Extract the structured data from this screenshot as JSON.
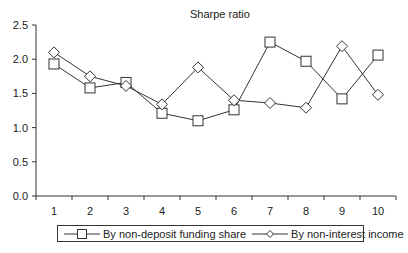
{
  "chart_data": {
    "type": "line",
    "title": "Sharpe ratio",
    "xlabel": "",
    "ylabel": "",
    "categories": [
      "1",
      "2",
      "3",
      "4",
      "5",
      "6",
      "7",
      "8",
      "9",
      "10"
    ],
    "y_ticks": [
      "0.0",
      "0.5",
      "1.0",
      "1.5",
      "2.0",
      "2.5"
    ],
    "ylim": [
      0,
      2.5
    ],
    "grid": false,
    "legend_position": "bottom",
    "series": [
      {
        "name": "By non-deposit funding share",
        "marker": "square",
        "values": [
          1.93,
          1.58,
          1.66,
          1.21,
          1.1,
          1.26,
          2.25,
          1.97,
          1.42,
          2.06
        ]
      },
      {
        "name": "By non-interest income",
        "marker": "diamond",
        "values": [
          2.1,
          1.75,
          1.61,
          1.34,
          1.88,
          1.4,
          1.36,
          1.29,
          2.19,
          1.48
        ]
      }
    ]
  },
  "colors": {
    "line": "#333333",
    "marker_fill": "#ffffff",
    "axis": "#333333"
  }
}
